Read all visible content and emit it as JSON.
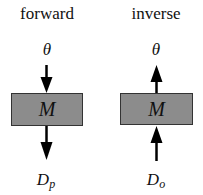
{
  "panels": [
    {
      "title": "forward",
      "top_label": "θ",
      "box_label": "M",
      "bottom_label_main": "D",
      "bottom_label_sub": "p",
      "direction": "down"
    },
    {
      "title": "inverse",
      "top_label": "θ",
      "box_label": "M",
      "bottom_label_main": "D",
      "bottom_label_sub": "o",
      "direction": "up"
    }
  ],
  "colors": {
    "box_fill": "#8c8c8c",
    "box_border": "#333333",
    "arrow": "#000000"
  }
}
